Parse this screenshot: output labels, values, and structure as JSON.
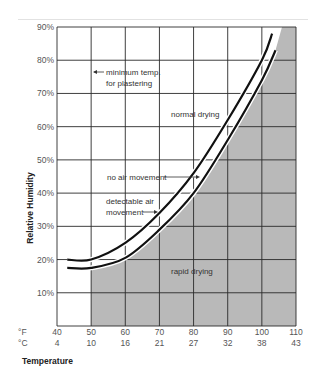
{
  "chart_data": {
    "type": "line",
    "title": "",
    "xlabel": "Temperature",
    "ylabel": "Relative Humidity",
    "x_units": [
      "°F",
      "°C"
    ],
    "x_ticks_f": [
      "40",
      "50",
      "60",
      "70",
      "80",
      "90",
      "100",
      "110"
    ],
    "x_ticks_c": [
      "4",
      "10",
      "16",
      "21",
      "27",
      "32",
      "38",
      "43"
    ],
    "y_ticks": [
      "10%",
      "20%",
      "30%",
      "40%",
      "50%",
      "60%",
      "70%",
      "80%",
      "90%"
    ],
    "xlim": [
      40,
      110
    ],
    "ylim": [
      0,
      90
    ],
    "grid": true,
    "series": [
      {
        "name": "no air movement",
        "x": [
          43,
          50,
          60,
          70,
          80,
          90,
          100,
          103
        ],
        "values": [
          20,
          20,
          25,
          34,
          46,
          62,
          80,
          88
        ]
      },
      {
        "name": "detectable air movement",
        "x": [
          43,
          50,
          60,
          70,
          80,
          90,
          100,
          104
        ],
        "values": [
          17.5,
          17.5,
          20.5,
          29,
          40,
          56,
          74,
          83
        ]
      }
    ],
    "regions": [
      {
        "name": "normal drying",
        "position": "above curves"
      },
      {
        "name": "rapid drying",
        "position": "below curves, right of 50°F (shaded)"
      }
    ],
    "annotations": [
      {
        "text": "minimum temp. for plastering",
        "points_to": "50°F vertical line"
      },
      {
        "text": "normal drying"
      },
      {
        "text": "no air movement",
        "points_to": "upper curve"
      },
      {
        "text": "detectable air movement",
        "points_to": "lower curve"
      },
      {
        "text": "rapid drying"
      }
    ]
  },
  "labels": {
    "ylabel": "Relative Humidity",
    "xlabel": "Temperature",
    "unit_f": "°F",
    "unit_c": "°C",
    "min_temp_line1": "minimum temp.",
    "min_temp_line2": "for plastering",
    "normal_drying": "normal drying",
    "no_air": "no air movement",
    "detectable_line1": "detectable air",
    "detectable_line2": "movement",
    "rapid_drying": "rapid drying"
  },
  "colors": {
    "shade": "#b9b9b9",
    "grid": "#2a2a2a",
    "curve": "#111111"
  }
}
